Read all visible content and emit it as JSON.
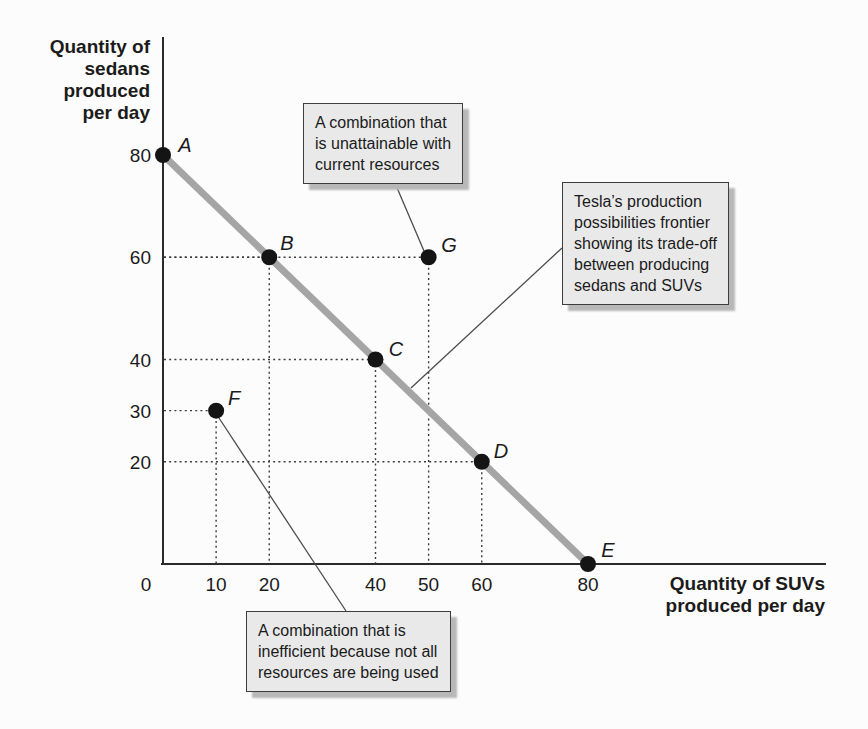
{
  "figure": {
    "background": "#fcfcfc",
    "y_axis_title": "Quantity of\nsedans\nproduced\nper day",
    "x_axis_title": "Quantity of SUVs\nproduced per day"
  },
  "chart_data": {
    "type": "line",
    "title": "",
    "xlabel": "Quantity of SUVs produced per day",
    "ylabel": "Quantity of sedans produced per day",
    "xlim": [
      0,
      80
    ],
    "ylim": [
      0,
      80
    ],
    "x_ticks": [
      0,
      10,
      20,
      40,
      50,
      60,
      80
    ],
    "y_ticks": [
      80,
      60,
      40,
      30,
      20
    ],
    "grid": "dotted guide lines from axes to points B, C, D, F, G only",
    "series": [
      {
        "name": "production possibilities frontier",
        "points": [
          {
            "label": "A",
            "x": 0,
            "y": 80
          },
          {
            "label": "B",
            "x": 20,
            "y": 60
          },
          {
            "label": "C",
            "x": 40,
            "y": 40
          },
          {
            "label": "D",
            "x": 60,
            "y": 20
          },
          {
            "label": "E",
            "x": 80,
            "y": 0
          }
        ]
      }
    ],
    "extra_points": [
      {
        "label": "F",
        "x": 10,
        "y": 30,
        "meaning": "inefficient"
      },
      {
        "label": "G",
        "x": 50,
        "y": 60,
        "meaning": "unattainable"
      }
    ],
    "guide_points": [
      "B",
      "C",
      "D",
      "F",
      "G"
    ],
    "colors": {
      "frontier_line": "#a5a5a5",
      "point_fill": "#141414",
      "axis": "#2b2b2b",
      "dotted_guide": "#3c3c3c",
      "leader_line": "#4c4c4c",
      "callout_fill": "#e9e9e9",
      "callout_border": "#3d3d3d",
      "callout_shadow": "#b8b8b8",
      "text": "#1b1b1b"
    }
  },
  "annotations": {
    "unattainable": {
      "text": "A combination that\nis unattainable with\ncurrent resources",
      "target": "G"
    },
    "frontier": {
      "text": "Tesla’s production\npossibilities frontier\nshowing its trade-off\nbetween producing\nsedans and SUVs",
      "target": "frontier line"
    },
    "inefficient": {
      "text": "A combination that is\ninefficient because not all\nresources are being used",
      "target": "F"
    }
  }
}
